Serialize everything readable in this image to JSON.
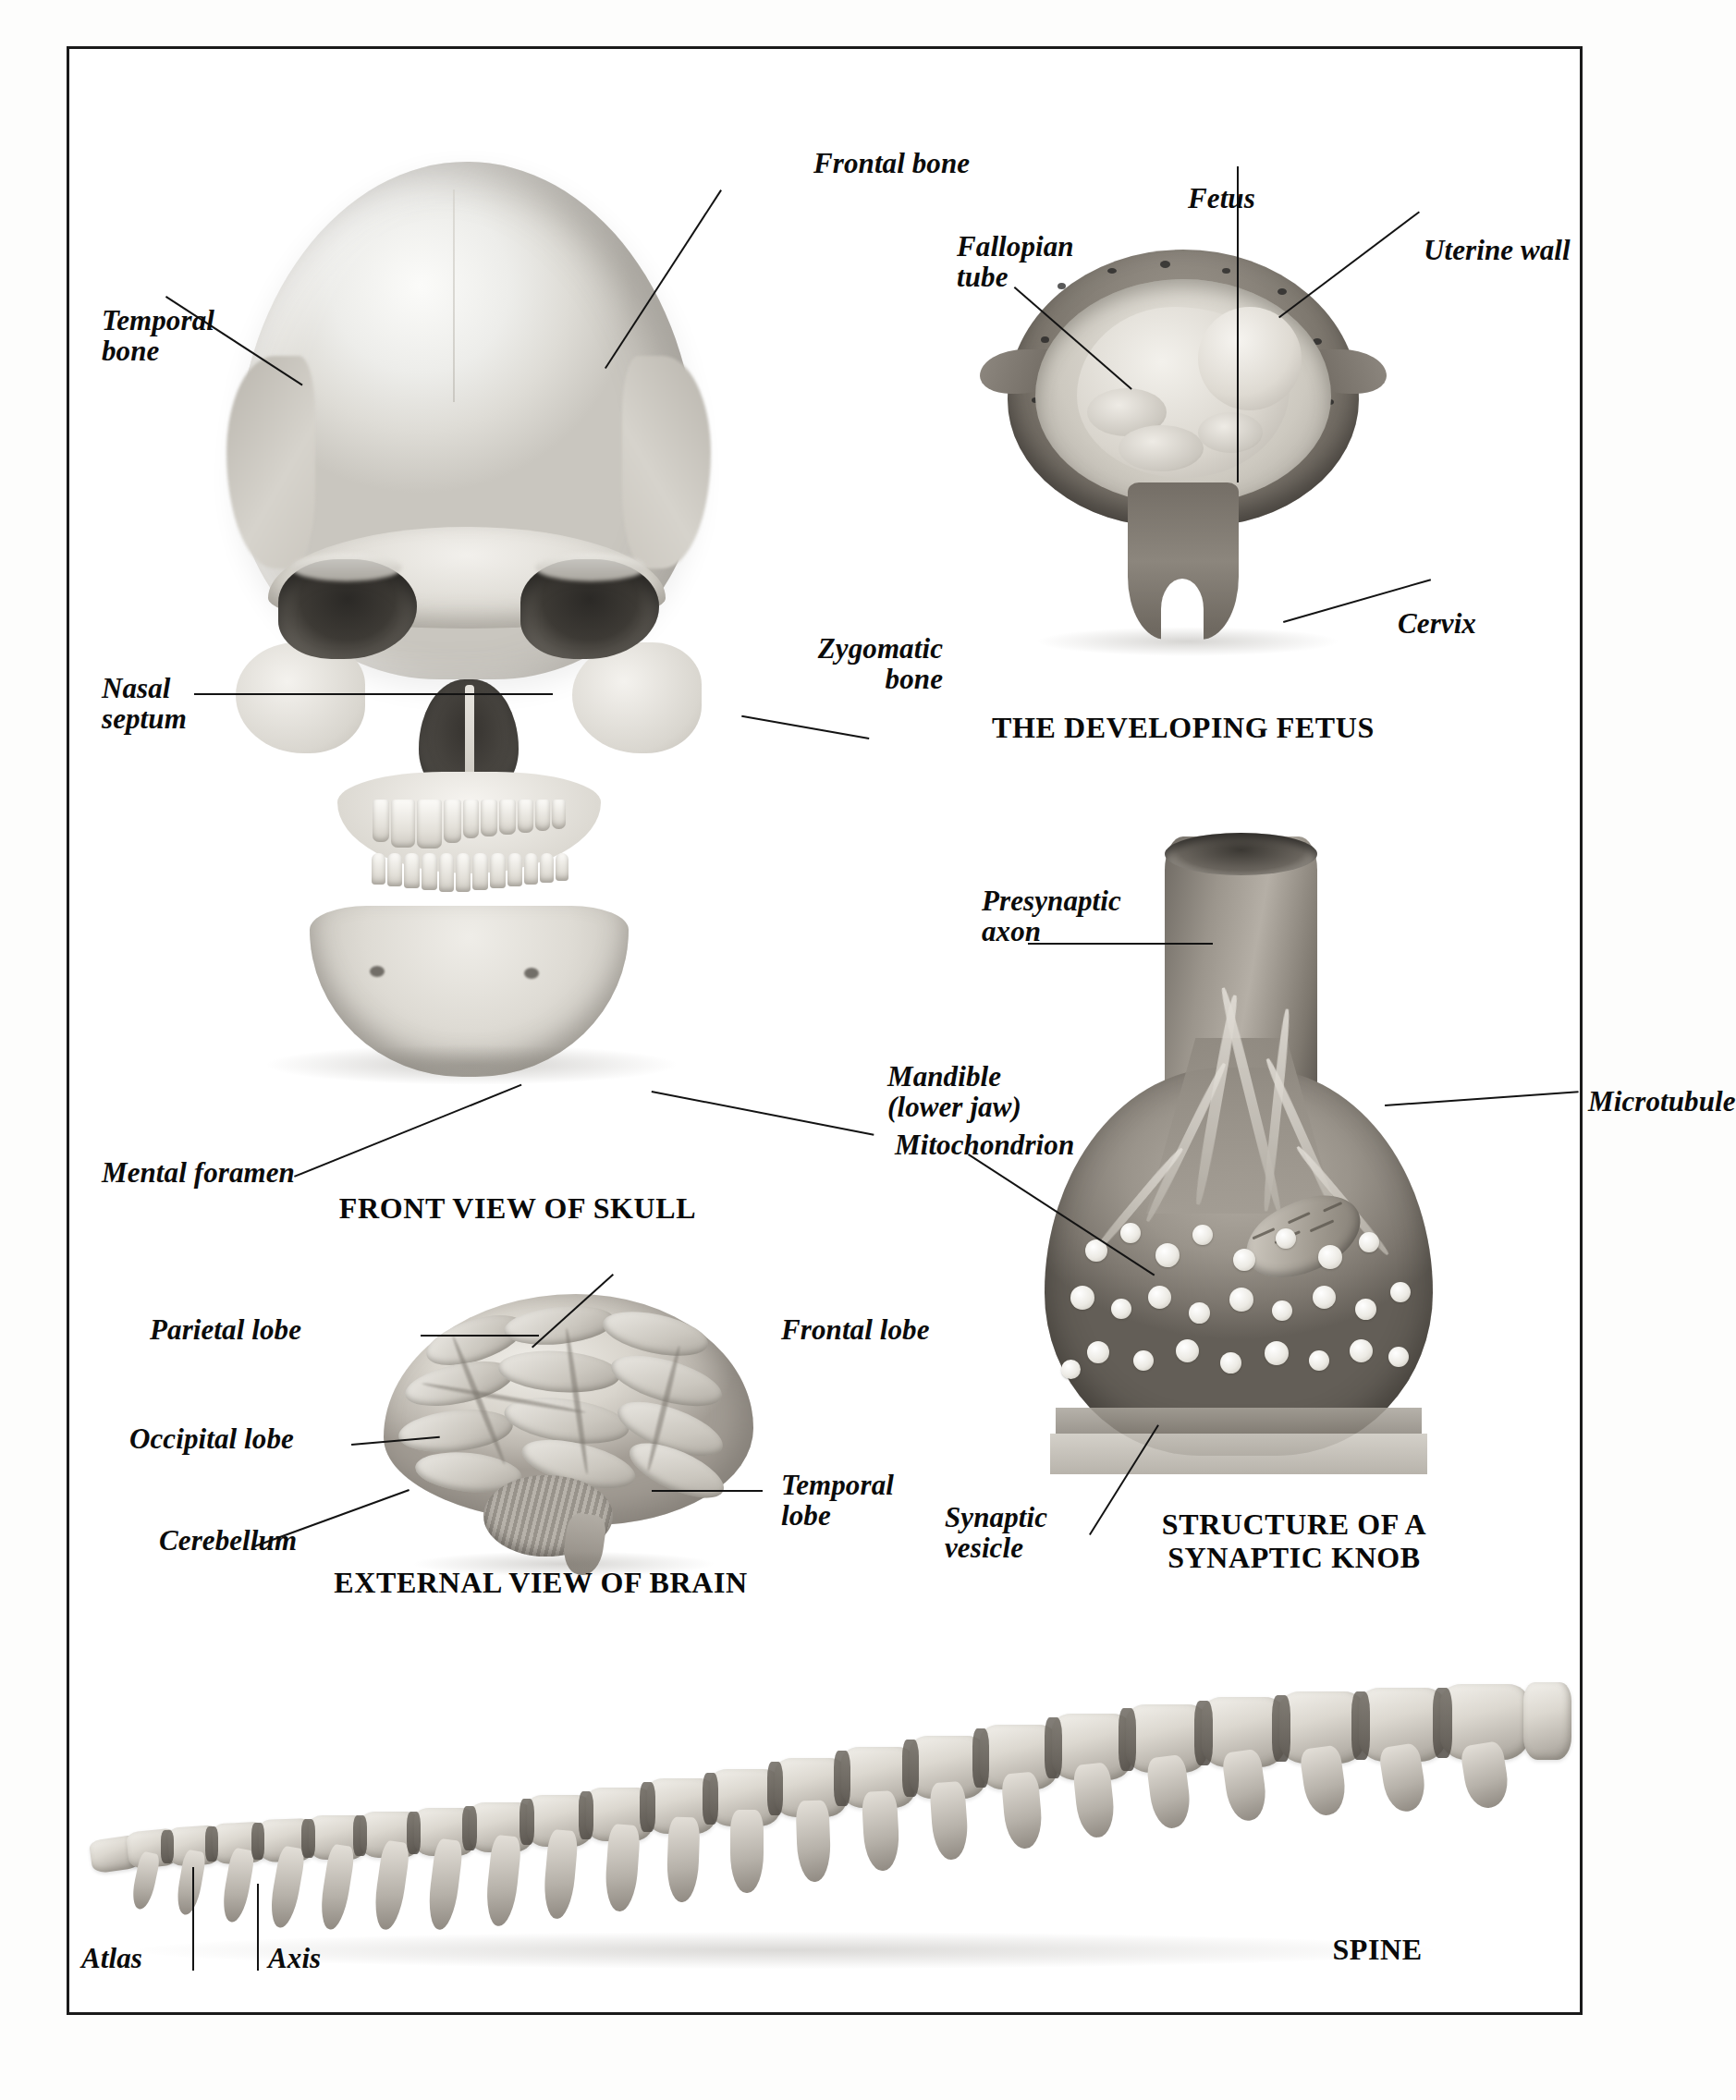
{
  "page": {
    "background_color": "#ffffff",
    "border_color": "#1a1a1a"
  },
  "figures": [
    {
      "id": "skull",
      "caption": "FRONT VIEW OF SKULL",
      "labels": [
        {
          "name": "frontal-bone",
          "text": "Frontal bone",
          "align": "left"
        },
        {
          "name": "temporal-bone",
          "text": "Temporal\nbone",
          "align": "left"
        },
        {
          "name": "nasal-septum",
          "text": "Nasal\nseptum",
          "align": "left"
        },
        {
          "name": "zygomatic-bone",
          "text": "Zygomatic\nbone",
          "align": "right"
        },
        {
          "name": "mental-foramen",
          "text": "Mental foramen",
          "align": "left"
        },
        {
          "name": "mandible",
          "text": "Mandible\n(lower jaw)",
          "align": "left"
        }
      ]
    },
    {
      "id": "fetus",
      "caption": "THE DEVELOPING FETUS",
      "labels": [
        {
          "name": "fetus",
          "text": "Fetus",
          "align": "left"
        },
        {
          "name": "fallopian-tube",
          "text": "Fallopian\ntube",
          "align": "left"
        },
        {
          "name": "uterine-wall",
          "text": "Uterine wall",
          "align": "left"
        },
        {
          "name": "cervix",
          "text": "Cervix",
          "align": "left"
        }
      ]
    },
    {
      "id": "synaptic-knob",
      "caption": "STRUCTURE OF A\nSYNAPTIC KNOB",
      "labels": [
        {
          "name": "presynaptic-axon",
          "text": "Presynaptic\naxon",
          "align": "left"
        },
        {
          "name": "microtubule",
          "text": "Microtubule",
          "align": "left"
        },
        {
          "name": "mitochondrion",
          "text": "Mitochondrion",
          "align": "left"
        },
        {
          "name": "synaptic-vesicle",
          "text": "Synaptic\nvesicle",
          "align": "left"
        }
      ]
    },
    {
      "id": "brain",
      "caption": "EXTERNAL VIEW OF BRAIN",
      "labels": [
        {
          "name": "parietal-lobe",
          "text": "Parietal lobe",
          "align": "left"
        },
        {
          "name": "occipital-lobe",
          "text": "Occipital lobe",
          "align": "left"
        },
        {
          "name": "cerebellum",
          "text": "Cerebellum",
          "align": "left"
        },
        {
          "name": "frontal-lobe",
          "text": "Frontal lobe",
          "align": "left"
        },
        {
          "name": "temporal-lobe",
          "text": "Temporal\nlobe",
          "align": "left"
        }
      ]
    },
    {
      "id": "spine",
      "caption": "SPINE",
      "labels": [
        {
          "name": "atlas",
          "text": "Atlas",
          "align": "left"
        },
        {
          "name": "axis",
          "text": "Axis",
          "align": "left"
        }
      ]
    }
  ],
  "captions": {
    "skull": "FRONT VIEW OF SKULL",
    "fetus": "THE DEVELOPING FETUS",
    "knob": "STRUCTURE OF A\nSYNAPTIC KNOB",
    "brain": "EXTERNAL VIEW OF BRAIN",
    "spine": "SPINE"
  },
  "labels": {
    "frontal_bone": "Frontal bone",
    "temporal_bone": "Temporal\nbone",
    "nasal_septum": "Nasal\nseptum",
    "zygomatic_bone": "Zygomatic\nbone",
    "mental_foramen": "Mental foramen",
    "mandible": "Mandible\n(lower jaw)",
    "fetus": "Fetus",
    "fallopian_tube": "Fallopian\ntube",
    "uterine_wall": "Uterine wall",
    "cervix": "Cervix",
    "presynaptic_axon": "Presynaptic\naxon",
    "microtubule": "Microtubule",
    "mitochondrion": "Mitochondrion",
    "synaptic_vesicle": "Synaptic\nvesicle",
    "parietal_lobe": "Parietal lobe",
    "occipital_lobe": "Occipital lobe",
    "cerebellum": "Cerebellum",
    "frontal_lobe": "Frontal lobe",
    "temporal_lobe": "Temporal\nlobe",
    "atlas": "Atlas",
    "axis": "Axis"
  }
}
